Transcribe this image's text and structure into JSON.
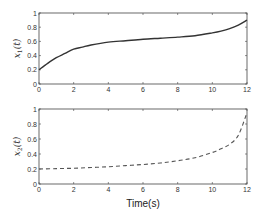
{
  "chart_data": [
    {
      "type": "line",
      "title": "",
      "xlabel": "",
      "ylabel": "x1(t)",
      "xlim": [
        0,
        12
      ],
      "ylim": [
        0,
        1
      ],
      "xticks": [
        "0",
        "2",
        "4",
        "6",
        "8",
        "10",
        "12"
      ],
      "yticks": [
        "0",
        "0.2",
        "0.4",
        "0.6",
        "0.8",
        "1"
      ],
      "grid": false,
      "series": [
        {
          "name": "x1(t)",
          "style": "solid",
          "color": "#333333",
          "x": [
            0,
            0.5,
            1,
            1.5,
            2,
            2.5,
            3,
            4,
            5,
            6,
            7,
            8,
            9,
            10,
            10.5,
            11,
            11.5,
            12
          ],
          "y": [
            0.2,
            0.29,
            0.37,
            0.43,
            0.49,
            0.52,
            0.55,
            0.59,
            0.61,
            0.63,
            0.645,
            0.66,
            0.68,
            0.72,
            0.745,
            0.78,
            0.83,
            0.9
          ]
        }
      ]
    },
    {
      "type": "line",
      "title": "",
      "xlabel": "Time(s)",
      "ylabel": "x2(t)",
      "xlim": [
        0,
        12
      ],
      "ylim": [
        0,
        1
      ],
      "xticks": [
        "0",
        "2",
        "4",
        "6",
        "8",
        "10",
        "12"
      ],
      "yticks": [
        "0",
        "0.2",
        "0.4",
        "0.6",
        "0.8",
        "1"
      ],
      "grid": false,
      "series": [
        {
          "name": "x2(t)",
          "style": "dashed",
          "color": "#555555",
          "x": [
            0,
            1,
            2,
            3,
            4,
            5,
            6,
            7,
            8,
            9,
            10,
            10.5,
            11,
            11.5,
            12
          ],
          "y": [
            0.2,
            0.205,
            0.21,
            0.22,
            0.23,
            0.245,
            0.26,
            0.28,
            0.31,
            0.35,
            0.42,
            0.47,
            0.53,
            0.65,
            0.95
          ]
        }
      ]
    }
  ]
}
